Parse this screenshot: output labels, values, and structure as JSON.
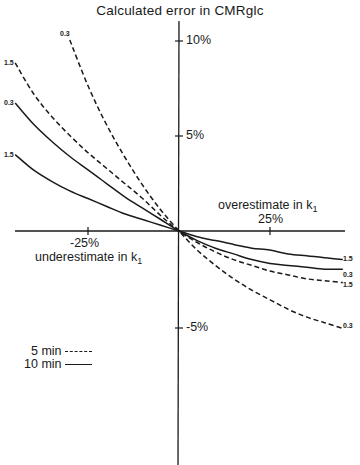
{
  "chart_data": {
    "type": "line",
    "title": "Calculated error in CMRglc",
    "xlabel_positive": "overestimate in k1",
    "xlabel_negative": "underestimate in k1",
    "ylabel": "Calculated error in CMRglc (%)",
    "x_ticks": [
      {
        "value": -25,
        "label": "-25%"
      },
      {
        "value": 25,
        "label": "25%"
      }
    ],
    "y_ticks": [
      {
        "value": 10,
        "label": "10%"
      },
      {
        "value": 5,
        "label": "5%"
      },
      {
        "value": -5,
        "label": "-5%"
      }
    ],
    "xlim": [
      -45,
      45
    ],
    "ylim": [
      -12,
      10.5
    ],
    "grid": false,
    "legend": [
      {
        "label": "5 min",
        "style": "dashed"
      },
      {
        "label": "10 min",
        "style": "solid"
      }
    ],
    "series": [
      {
        "name": "5 min, 0.3",
        "curve_label": "0.3",
        "style": "dashed",
        "x": [
          -30,
          -25,
          -20,
          -15,
          -10,
          -5,
          0,
          5,
          10,
          15,
          20,
          25,
          30,
          35,
          40,
          45
        ],
        "y": [
          10.0,
          7.6,
          5.6,
          3.9,
          2.4,
          1.1,
          0.0,
          -1.0,
          -1.8,
          -2.5,
          -3.1,
          -3.6,
          -4.1,
          -4.5,
          -4.8,
          -5.1
        ]
      },
      {
        "name": "5 min, 1.5",
        "curve_label": "1.5",
        "style": "dashed",
        "x": [
          -45,
          -40,
          -35,
          -30,
          -25,
          -20,
          -15,
          -10,
          -5,
          0,
          5,
          10,
          15,
          20,
          25,
          30,
          35,
          40,
          45
        ],
        "y": [
          8.8,
          7.2,
          6.0,
          5.0,
          4.1,
          3.3,
          2.5,
          1.7,
          0.8,
          0.0,
          -0.6,
          -1.1,
          -1.5,
          -1.8,
          -2.1,
          -2.3,
          -2.5,
          -2.6,
          -2.7
        ]
      },
      {
        "name": "10 min, 0.3",
        "curve_label": "0.3",
        "style": "solid",
        "x": [
          -45,
          -40,
          -35,
          -30,
          -25,
          -20,
          -15,
          -10,
          -5,
          0,
          5,
          10,
          15,
          20,
          25,
          30,
          35,
          40,
          45
        ],
        "y": [
          6.7,
          5.6,
          4.7,
          3.9,
          3.2,
          2.5,
          1.8,
          1.2,
          0.6,
          0.0,
          -0.5,
          -0.9,
          -1.2,
          -1.5,
          -1.7,
          -1.8,
          -1.9,
          -2.0,
          -2.0
        ]
      },
      {
        "name": "10 min, 1.5",
        "curve_label": "1.5",
        "style": "solid",
        "x": [
          -45,
          -40,
          -35,
          -30,
          -25,
          -20,
          -15,
          -10,
          -5,
          0,
          5,
          10,
          15,
          20,
          25,
          30,
          35,
          40,
          45
        ],
        "y": [
          4.0,
          3.2,
          2.6,
          2.1,
          1.7,
          1.3,
          0.9,
          0.6,
          0.3,
          0.0,
          -0.3,
          -0.5,
          -0.7,
          -0.9,
          -1.0,
          -1.2,
          -1.3,
          -1.4,
          -1.5
        ]
      }
    ]
  },
  "labels": {
    "title": "Calculated error in  CMRglc",
    "y_tick_10": "10%",
    "y_tick_5": "5%",
    "y_tick_m5": "-5%",
    "x_tick_m25": "-25%",
    "x_tick_25": "25%",
    "over_text": "overestimate in k",
    "under_text": "underestimate in k",
    "subscript": "1",
    "legend_5min": "5 min",
    "legend_10min": "10 min",
    "lbl_d03_left": "0.3",
    "lbl_d15_left": "1.5",
    "lbl_s03_left": "0.3",
    "lbl_s15_left": "1.5",
    "lbl_s15_right": "1.5",
    "lbl_s03_right": "0.3",
    "lbl_d15_right": "1.5",
    "lbl_d03_right": "0.3"
  },
  "colors": {
    "ink": "#1a1a1a",
    "background": "#ffffff"
  }
}
